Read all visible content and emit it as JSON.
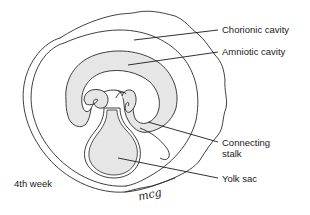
{
  "figure": {
    "caption": "4th week",
    "signature": "mcg",
    "colors": {
      "stroke": "#2a2a2a",
      "fill": "#e6e6e6",
      "background": "#ffffff"
    },
    "labels": [
      {
        "id": "chorionic-cavity",
        "text": "Chorionic cavity"
      },
      {
        "id": "amniotic-cavity",
        "text": "Amniotic cavity"
      },
      {
        "id": "connecting-stalk",
        "line1": "Connecting",
        "line2": "stalk"
      },
      {
        "id": "yolk-sac",
        "text": "Yolk sac"
      }
    ]
  }
}
